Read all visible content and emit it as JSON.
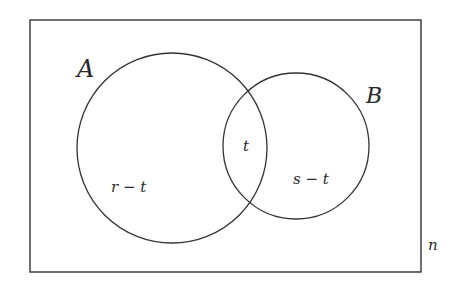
{
  "diagram": {
    "type": "venn",
    "universe": {
      "label": "n"
    },
    "sets": [
      {
        "name": "A",
        "label": "A",
        "region_label": "r − t"
      },
      {
        "name": "B",
        "label": "B",
        "region_label": "s − t"
      }
    ],
    "intersection": {
      "label": "t"
    },
    "colors": {
      "stroke": "#333333",
      "text": "#2a2a2a",
      "background": "#ffffff"
    }
  }
}
